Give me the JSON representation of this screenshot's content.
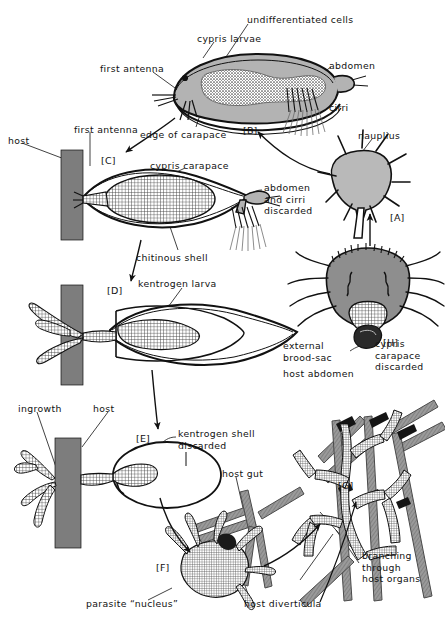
{
  "figure": {
    "type": "biological-life-cycle-diagram",
    "background_color": "#ffffff",
    "ink_color": "#111111",
    "host_fill_color": "#7d7d7d",
    "organism_fill_color": "#b0b0b0",
    "tissue_fill_color": "#8e8e8e"
  },
  "stages": [
    {
      "id": "A",
      "label": "[A]",
      "name": "nauplius-larva",
      "x": 390,
      "y": 212
    },
    {
      "id": "B",
      "label": "[B]",
      "name": "cypris-larva-free",
      "x": 243,
      "y": 125
    },
    {
      "id": "C",
      "label": "[C]",
      "name": "cypris-attached",
      "x": 101,
      "y": 155
    },
    {
      "id": "D",
      "label": "[D]",
      "name": "kentrogen-larva",
      "x": 107,
      "y": 285
    },
    {
      "id": "E",
      "label": "[E]",
      "name": "kentrogen-shell-shed",
      "x": 136,
      "y": 433
    },
    {
      "id": "F",
      "label": "[F]",
      "name": "parasite-nucleus",
      "x": 156,
      "y": 562
    },
    {
      "id": "G",
      "label": "[G]",
      "name": "branching-stage",
      "x": 338,
      "y": 480
    },
    {
      "id": "H",
      "label": "[H]",
      "name": "external-brood-sac",
      "x": 383,
      "y": 337
    }
  ],
  "labels": [
    {
      "name": "undifferentiated-cells",
      "text": "undifferentiated cells",
      "x": 247,
      "y": 14,
      "align": "left"
    },
    {
      "name": "cypris-larvae",
      "text": "cypris larvae",
      "x": 197,
      "y": 33,
      "align": "left"
    },
    {
      "name": "abdomen-top",
      "text": "abdomen",
      "x": 329,
      "y": 60,
      "align": "left"
    },
    {
      "name": "first-antenna-top",
      "text": "first antenna",
      "x": 100,
      "y": 63,
      "align": "left"
    },
    {
      "name": "cirri",
      "text": "cirri",
      "x": 329,
      "y": 102,
      "align": "left"
    },
    {
      "name": "edge-of-carapace",
      "text": "edge of carapace",
      "x": 140,
      "y": 129,
      "align": "left"
    },
    {
      "name": "nauplius",
      "text": "nauplius",
      "x": 358,
      "y": 130,
      "align": "left"
    },
    {
      "name": "host-top",
      "text": "host",
      "x": 8,
      "y": 135,
      "align": "left"
    },
    {
      "name": "first-antenna-c",
      "text": "first antenna",
      "x": 74,
      "y": 124,
      "align": "left"
    },
    {
      "name": "cypris-carapace",
      "text": "cypris carapace",
      "x": 150,
      "y": 160,
      "align": "left"
    },
    {
      "name": "abdomen-and-cirri-discarded",
      "text": "abdomen\nand cirri\ndiscarded",
      "x": 264,
      "y": 182,
      "align": "left"
    },
    {
      "name": "chitinous-shell",
      "text": "chitinous shell",
      "x": 136,
      "y": 252,
      "align": "left"
    },
    {
      "name": "kentrogen-larva",
      "text": "kentrogen larva",
      "x": 138,
      "y": 278,
      "align": "left"
    },
    {
      "name": "cypris-carapace-discarded",
      "text": "cypris\ncarapace\ndiscarded",
      "x": 375,
      "y": 338,
      "align": "left"
    },
    {
      "name": "external-brood-sac",
      "text": "external\nbrood-sac",
      "x": 283,
      "y": 340,
      "align": "left"
    },
    {
      "name": "host-abdomen",
      "text": "host abdomen",
      "x": 283,
      "y": 368,
      "align": "left"
    },
    {
      "name": "ingrowth",
      "text": "ingrowth",
      "x": 18,
      "y": 403,
      "align": "left"
    },
    {
      "name": "host-middle",
      "text": "host",
      "x": 93,
      "y": 403,
      "align": "left"
    },
    {
      "name": "kentrogen-shell-discarded",
      "text": "kentrogen shell\ndiscarded",
      "x": 178,
      "y": 428,
      "align": "left"
    },
    {
      "name": "host-gut",
      "text": "host gut",
      "x": 222,
      "y": 468,
      "align": "left"
    },
    {
      "name": "branching-through-host-organs",
      "text": "branching\nthrough\nhost organs",
      "x": 362,
      "y": 550,
      "align": "left"
    },
    {
      "name": "parasite-nucleus",
      "text": "parasite “nucleus”",
      "x": 86,
      "y": 598,
      "align": "left"
    },
    {
      "name": "host-diverticula",
      "text": "host diverticula",
      "x": 244,
      "y": 598,
      "align": "left"
    }
  ],
  "caption": {
    "text": "",
    "visible": false
  }
}
